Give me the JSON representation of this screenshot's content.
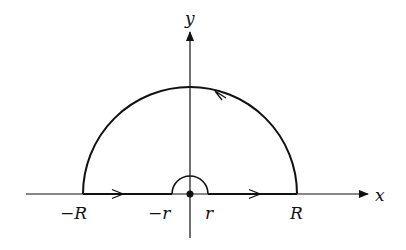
{
  "diagram": {
    "axes": {
      "x_label": "x",
      "y_label": "y"
    },
    "labels": {
      "neg_R": "−R",
      "neg_r": "−r",
      "pos_r": "r",
      "pos_R": "R"
    },
    "geometry": {
      "origin": [
        190,
        194
      ],
      "big_radius": 107,
      "small_radius": 18
    },
    "colors": {
      "stroke": "#111111",
      "background": "#ffffff"
    }
  }
}
